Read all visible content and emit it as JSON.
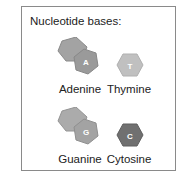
{
  "title": "Nucleotide bases:",
  "bases": [
    {
      "name": "Adenine",
      "letter": "A",
      "shape": "purine",
      "color": "#9a9a9a"
    },
    {
      "name": "Thymine",
      "letter": "T",
      "shape": "pyrimidine",
      "color": "#c0c0c0"
    },
    {
      "name": "Guanine",
      "letter": "G",
      "shape": "purine",
      "color": "#a3a3a3"
    },
    {
      "name": "Cytosine",
      "letter": "C",
      "shape": "pyrimidine",
      "color": "#707070"
    }
  ]
}
